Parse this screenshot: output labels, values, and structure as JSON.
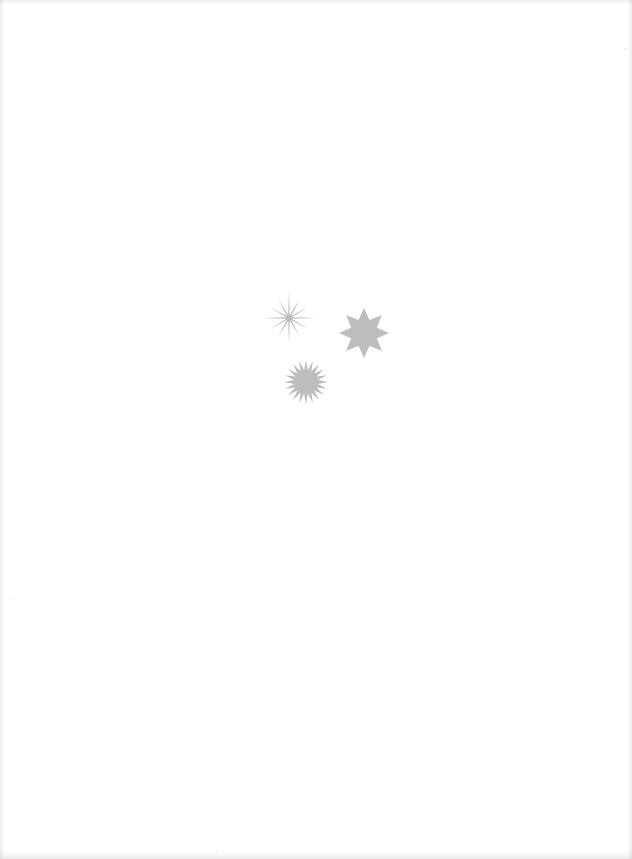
{
  "page": {
    "background": "#ffffff"
  },
  "shapes": [
    {
      "name": "thin-twelve-point-star",
      "points": 12,
      "center": [
        289,
        318
      ],
      "outer_radius_long": 27,
      "outer_radius_short": 22,
      "inner_radius": 3,
      "color": "#bdbdbd"
    },
    {
      "name": "eight-point-star",
      "points": 8,
      "center": [
        364,
        333
      ],
      "outer_radius": 25,
      "inner_radius": 14,
      "color": "#bdbdbd"
    },
    {
      "name": "sunburst-star",
      "points": 20,
      "center": [
        306,
        382
      ],
      "outer_radius": 22,
      "inner_radius": 12,
      "color": "#bdbdbd"
    }
  ]
}
